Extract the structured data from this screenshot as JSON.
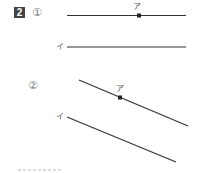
{
  "problem": {
    "number": "2",
    "parts": [
      {
        "marker": "①",
        "line_a": {
          "label": "ア",
          "x1": 67,
          "y1": 15.5,
          "x2": 186,
          "y2": 15.5
        },
        "point_a": {
          "x": 139,
          "y": 15.5
        },
        "line_b": {
          "label": "イ",
          "x1": 67,
          "y1": 47,
          "x2": 186,
          "y2": 47
        }
      },
      {
        "marker": "②",
        "line_a": {
          "label": "ア",
          "x1": 79,
          "y1": 80,
          "x2": 188,
          "y2": 126
        },
        "point_a": {
          "x": 120,
          "y": 97.5
        },
        "line_b": {
          "label": "イ",
          "x1": 67,
          "y1": 117,
          "x2": 176,
          "y2": 162
        }
      }
    ]
  },
  "colors": {
    "line": "#333333",
    "badge_bg": "#444444",
    "label": "#555555"
  }
}
